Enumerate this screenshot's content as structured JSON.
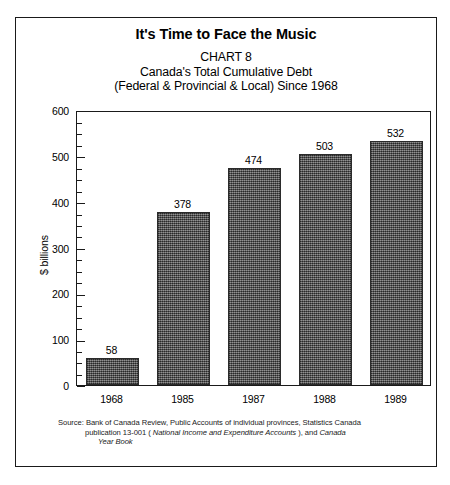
{
  "figure": {
    "main_title": "It's Time to Face the Music",
    "subtitle_lines": [
      "CHART 8",
      "Canada's Total Cumulative Debt",
      "(Federal & Provincial & Local) Since 1968"
    ],
    "source": {
      "line1": "Source: Bank of Canada Review, Public Accounts of individual provinces, Statistics Canada",
      "line2_prefix": "publication 13-001 ( ",
      "line2_italic": "National Income and Expenditure Accounts",
      "line2_suffix": " ), and  ",
      "line2_italic2": "Canada",
      "line3_italic": "Year Book"
    }
  },
  "chart_data": {
    "type": "bar",
    "title": "It's Time to Face the Music",
    "subtitle": "CHART 8 — Canada's Total Cumulative Debt (Federal & Provincial & Local) Since 1968",
    "categories": [
      "1968",
      "1985",
      "1987",
      "1988",
      "1989"
    ],
    "values": [
      58,
      378,
      474,
      503,
      532
    ],
    "value_labels": [
      "58",
      "378",
      "474",
      "503",
      "532"
    ],
    "xlabel": "",
    "ylabel": "$ billions",
    "ylim": [
      0,
      600
    ],
    "ytick_major": [
      0,
      100,
      200,
      300,
      400,
      500,
      600
    ],
    "ytick_major_labels": [
      "0",
      "100",
      "200",
      "300",
      "400",
      "500",
      "600"
    ],
    "ytick_minor_step": 25,
    "grid": false,
    "legend": false,
    "bar_color": "#4f4f4f",
    "bar_edge_color": "#2b2b2b",
    "background_color": "#ffffff",
    "frame_color": "#1a1a1a"
  }
}
